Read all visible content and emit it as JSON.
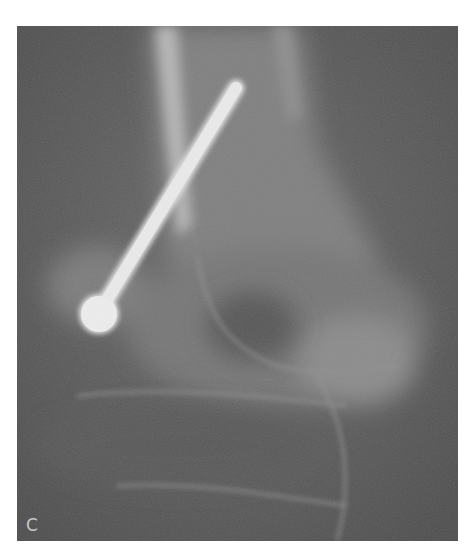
{
  "figure": {
    "panel_label": "C",
    "type": "radiograph",
    "colors": {
      "background": "#5e5e5e",
      "bone": "#9a9a9a",
      "implant": "#e4e4e4",
      "page": "#ffffff"
    }
  }
}
